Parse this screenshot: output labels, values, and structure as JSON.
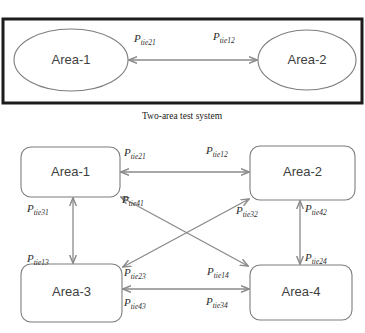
{
  "figure": {
    "caption": "Two-area test system"
  },
  "top_diagram": {
    "nodes": [
      {
        "id": "area1",
        "label": "Area-1",
        "shape": "ellipse",
        "cx": 71,
        "cy": 60,
        "rx": 57,
        "ry": 31
      },
      {
        "id": "area2",
        "label": "Area-2",
        "shape": "ellipse",
        "cx": 307,
        "cy": 60,
        "rx": 49,
        "ry": 30
      }
    ],
    "links": [
      {
        "from": "area1",
        "to": "area2",
        "x1": 129,
        "y1": 60,
        "x2": 257,
        "y2": 60,
        "labels": [
          {
            "base": "P",
            "sub": "tie21",
            "x": 134,
            "y": 42
          },
          {
            "base": "P",
            "sub": "tie12",
            "x": 213,
            "y": 40
          }
        ]
      }
    ]
  },
  "bottom_diagram": {
    "nodes": [
      {
        "id": "area1",
        "label": "Area-1",
        "shape": "rect",
        "x": 21,
        "y": 147,
        "w": 99,
        "h": 50
      },
      {
        "id": "area2",
        "label": "Area-2",
        "shape": "rect",
        "x": 250,
        "y": 146,
        "w": 105,
        "h": 54
      },
      {
        "id": "area3",
        "label": "Area-3",
        "shape": "rect",
        "x": 21,
        "y": 264,
        "w": 101,
        "h": 58
      },
      {
        "id": "area4",
        "label": "Area-4",
        "shape": "rect",
        "x": 250,
        "y": 265,
        "w": 102,
        "h": 55
      }
    ],
    "links": [
      {
        "id": "link-1-2",
        "from": "area1",
        "to": "area2",
        "x1": 121,
        "y1": 172,
        "x2": 249,
        "y2": 172,
        "labels": [
          {
            "base": "P",
            "sub": "tie21",
            "x": 124,
            "y": 156
          },
          {
            "base": "P",
            "sub": "tie12",
            "x": 206,
            "y": 154
          }
        ]
      },
      {
        "id": "link-3-4",
        "from": "area3",
        "to": "area4",
        "x1": 123,
        "y1": 289,
        "x2": 249,
        "y2": 289,
        "labels": [
          {
            "base": "P",
            "sub": "tie43",
            "x": 124,
            "y": 306
          },
          {
            "base": "P",
            "sub": "tie34",
            "x": 206,
            "y": 305
          }
        ]
      },
      {
        "id": "link-1-3",
        "from": "area1",
        "to": "area3",
        "x1": 73,
        "y1": 198,
        "x2": 73,
        "y2": 263,
        "labels": [
          {
            "base": "P",
            "sub": "tie31",
            "x": 27,
            "y": 212
          },
          {
            "base": "P",
            "sub": "tie13",
            "x": 27,
            "y": 262
          }
        ]
      },
      {
        "id": "link-2-4",
        "from": "area2",
        "to": "area4",
        "x1": 300,
        "y1": 201,
        "x2": 300,
        "y2": 264,
        "labels": [
          {
            "base": "P",
            "sub": "tie42",
            "x": 305,
            "y": 212
          },
          {
            "base": "P",
            "sub": "tie24",
            "x": 305,
            "y": 261
          }
        ]
      },
      {
        "id": "link-1-4",
        "from": "area1",
        "to": "area4",
        "x1": 121,
        "y1": 197,
        "x2": 248,
        "y2": 266,
        "labels": [
          {
            "base": "P",
            "sub": "tie41",
            "x": 122,
            "y": 203
          },
          {
            "base": "P",
            "sub": "tie14",
            "x": 207,
            "y": 275
          }
        ]
      },
      {
        "id": "link-2-3",
        "from": "area3",
        "to": "area2",
        "x1": 123,
        "y1": 267,
        "x2": 249,
        "y2": 199,
        "labels": [
          {
            "base": "P",
            "sub": "tie23",
            "x": 124,
            "y": 276
          },
          {
            "base": "P",
            "sub": "tie32",
            "x": 236,
            "y": 214
          }
        ]
      }
    ]
  },
  "colors": {
    "node_stroke": "#7d7d7d",
    "frame_stroke": "#1c1c1c",
    "connector": "#8a8a8a",
    "text": "#3f3f3f"
  }
}
